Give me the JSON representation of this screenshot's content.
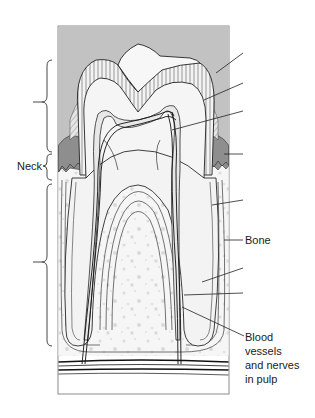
{
  "diagram": {
    "colors": {
      "background_gum": "#bdbdbd",
      "enamel_hatch": "#f2f2f2",
      "dentin": "#f4f4f4",
      "pulp": "#ebebeb",
      "gingiva_dark": "#8c8c8c",
      "bone": "#f7f7f7",
      "bone_spots": "#dcdcdc",
      "line": "#2a2a2a",
      "frame": "#6f6f6f"
    },
    "brackets": [
      {
        "id": "crown",
        "label": ""
      },
      {
        "id": "neck",
        "label": "Neck"
      },
      {
        "id": "root",
        "label": ""
      }
    ],
    "labels": {
      "neck": "Neck",
      "bone": "Bone",
      "blood_vessels": [
        "Blood",
        "vessels",
        "and nerves",
        "in pulp"
      ]
    },
    "leader_lines": [
      {
        "id": "enamel",
        "label": ""
      },
      {
        "id": "dentin",
        "label": ""
      },
      {
        "id": "pulp-cavity",
        "label": ""
      },
      {
        "id": "gingiva",
        "label": ""
      },
      {
        "id": "cementum",
        "label": ""
      },
      {
        "id": "bone",
        "label": "Bone"
      },
      {
        "id": "periodontal-ligament",
        "label": ""
      },
      {
        "id": "root-canal",
        "label": ""
      },
      {
        "id": "blood-vessels-nerves",
        "label": "Blood vessels and nerves in pulp"
      }
    ]
  }
}
